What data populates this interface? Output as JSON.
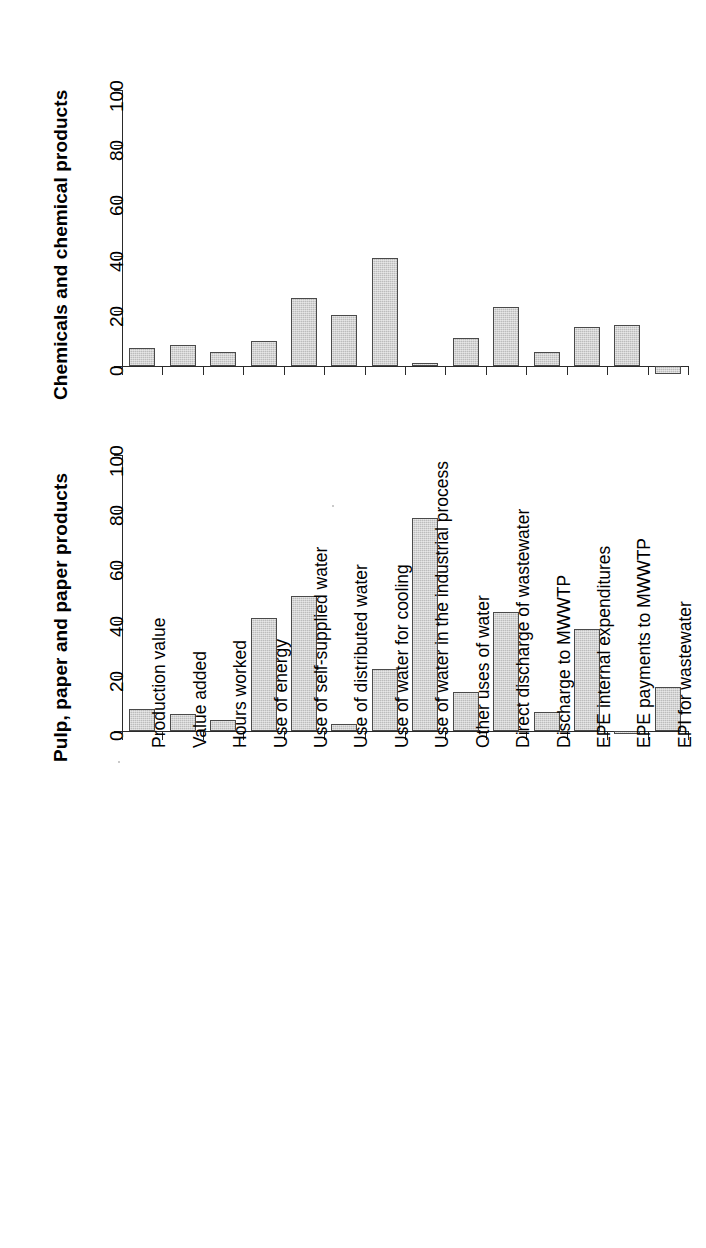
{
  "chart_data": [
    {
      "type": "bar",
      "title": "Chemicals and chemical products",
      "xlabel": "",
      "ylabel": "",
      "ylim": [
        -10,
        100
      ],
      "yticks": [
        0,
        20,
        40,
        60,
        80,
        100
      ],
      "grid": false,
      "legend": "none",
      "orientation": "vertical",
      "categories": [
        "Production value",
        "Value added",
        "Hours worked",
        "Use of energy",
        "Use of self-supplied water",
        "Use of distributed water",
        "Use of water for cooling",
        "Use of water in the industrial process",
        "Other uses of water",
        "Direct discharge of wastewater",
        "Discharge to MWWTP",
        "EPE internal expenditures",
        "EPE payments to MWWTP",
        "EPI for wastewater"
      ],
      "values": [
        6.5,
        7.5,
        5,
        9,
        24.5,
        18.5,
        39,
        1,
        10,
        21.5,
        5,
        14,
        15,
        -3
      ]
    },
    {
      "type": "bar",
      "title": "Pulp, paper and paper products",
      "xlabel": "",
      "ylabel": "",
      "ylim": [
        -10,
        100
      ],
      "yticks": [
        0,
        20,
        40,
        60,
        80,
        100
      ],
      "grid": false,
      "legend": "none",
      "orientation": "vertical",
      "categories": [
        "Production value",
        "Value added",
        "Hours worked",
        "Use of energy",
        "Use of self-supplied water",
        "Use of distributed water",
        "Use of water for cooling",
        "Use of water in the industrial process",
        "Other uses of water",
        "Direct discharge of wastewater",
        "Discharge to MWWTP",
        "EPE internal expenditures",
        "EPE payments to MWWTP",
        "EPI for wastewater"
      ],
      "values": [
        8,
        6,
        4,
        41,
        49,
        2.5,
        22.5,
        77,
        14,
        43,
        7,
        37,
        -1,
        16
      ]
    }
  ],
  "panels": {
    "top": {
      "title": "Chemicals and chemical products",
      "ytick_labels": [
        "0",
        "20",
        "40",
        "60",
        "80",
        "100"
      ]
    },
    "bottom": {
      "title": "Pulp, paper and paper products",
      "ytick_labels": [
        "0",
        "20",
        "40",
        "60",
        "80",
        "100"
      ]
    }
  },
  "colors": {
    "bar_fill": "#bcbcbc",
    "bar_edge": "#4a4a4a",
    "axis": "#2a2a2a",
    "text": "#000000",
    "background": "#ffffff"
  },
  "categories": [
    "Production value",
    "Value added",
    "Hours worked",
    "Use of energy",
    "Use of self-supplied water",
    "Use of distributed water",
    "Use of water for cooling",
    "Use of water in the industrial process",
    "Other uses of water",
    "Direct discharge of wastewater",
    "Discharge to MWWTP",
    "EPE internal expenditures",
    "EPE payments to MWWTP",
    "EPI for wastewater"
  ]
}
